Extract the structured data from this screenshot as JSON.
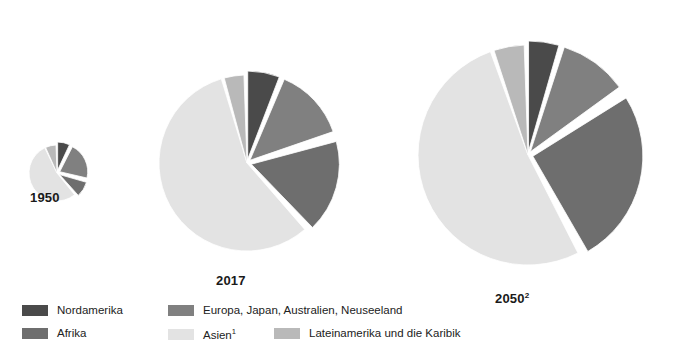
{
  "chart_data": {
    "type": "pie",
    "title": "",
    "subtitle": "",
    "xlabel": "",
    "ylabel": "",
    "legend_position": "bottom-left",
    "grid": false,
    "note": "Three area-proportional exploded pie charts comparing the regional distribution of world population in 1950, 2017 and 2050 (projection). Slice values are percentage shares read off the wedge angles; pie radius scales with total population.",
    "categories": [
      "Nordamerika",
      "Europa, Japan, Australien, Neuseeland",
      "Afrika",
      "Asien",
      "Lateinamerika und die Karibik"
    ],
    "colors": [
      "#4a4a4a",
      "#808080",
      "#6e6e6e",
      "#e3e3e3",
      "#b9b9b9"
    ],
    "series": [
      {
        "name": "1950",
        "label": "1950",
        "superscript": "",
        "relative_radius": 28,
        "values": [
          7,
          21,
          9,
          56,
          7
        ]
      },
      {
        "name": "2017",
        "label": "2017",
        "superscript": "",
        "relative_radius": 88,
        "values": [
          5,
          13,
          17,
          57,
          8
        ]
      },
      {
        "name": "2050",
        "label": "2050",
        "superscript": "2",
        "relative_radius": 110,
        "values": [
          4,
          10,
          26,
          52,
          8
        ]
      }
    ]
  },
  "pies": [
    {
      "id": "pie-1950",
      "label": "1950",
      "superscript": "",
      "cx": 57,
      "cy": 173,
      "r": 28,
      "label_x": 30,
      "label_y": 190,
      "label_size": 13,
      "slices": [
        {
          "name": "Nordamerika",
          "start": 0,
          "end": 25,
          "color": "#4a4a4a",
          "explode": 3.0
        },
        {
          "name": "Europa, Japan, Australien, Neuseeland",
          "start": 27,
          "end": 103,
          "color": "#808080",
          "explode": 3.0
        },
        {
          "name": "Afrika",
          "start": 106,
          "end": 138,
          "color": "#6e6e6e",
          "explode": 3.0
        },
        {
          "name": "Asien",
          "start": 141,
          "end": 334,
          "color": "#e3e3e3",
          "explode": 0.0
        },
        {
          "name": "Lateinamerika und die Karibik",
          "start": 336,
          "end": 358,
          "color": "#b9b9b9",
          "explode": 0.0
        }
      ]
    },
    {
      "id": "pie-2017",
      "label": "2017",
      "superscript": "",
      "cx": 247,
      "cy": 163,
      "r": 88,
      "label_x": 216,
      "label_y": 273,
      "label_size": 13,
      "slices": [
        {
          "name": "Nordamerika",
          "start": 0,
          "end": 21,
          "color": "#4a4a4a",
          "explode": 4.0
        },
        {
          "name": "Europa, Japan, Australien, Neuseeland",
          "start": 23,
          "end": 71,
          "color": "#808080",
          "explode": 4.0
        },
        {
          "name": "Afrika",
          "start": 75,
          "end": 136,
          "color": "#6e6e6e",
          "explode": 4.5
        },
        {
          "name": "Asien",
          "start": 139,
          "end": 343,
          "color": "#e3e3e3",
          "explode": 0.0
        },
        {
          "name": "Lateinamerika und die Karibik",
          "start": 345,
          "end": 358,
          "color": "#b9b9b9",
          "explode": 0.0
        }
      ]
    },
    {
      "id": "pie-2050",
      "label": "2050",
      "superscript": "2",
      "cx": 528,
      "cy": 155,
      "r": 110,
      "label_x": 495,
      "label_y": 291,
      "label_size": 13,
      "slices": [
        {
          "name": "Nordamerika",
          "start": 0,
          "end": 16,
          "color": "#4a4a4a",
          "explode": 4.0
        },
        {
          "name": "Europa, Japan, Australien, Neuseeland",
          "start": 18,
          "end": 54,
          "color": "#808080",
          "explode": 4.0
        },
        {
          "name": "Afrika",
          "start": 58,
          "end": 150,
          "color": "#6e6e6e",
          "explode": 5.0
        },
        {
          "name": "Asien",
          "start": 153,
          "end": 340,
          "color": "#e3e3e3",
          "explode": 0.0
        },
        {
          "name": "Lateinamerika und die Karibik",
          "start": 342,
          "end": 358,
          "color": "#b9b9b9",
          "explode": 0.0
        }
      ]
    }
  ],
  "legend": {
    "items": [
      {
        "label": "Nordamerika",
        "superscript": "",
        "color": "#4a4a4a",
        "x": 0,
        "y": 0
      },
      {
        "label": "Europa, Japan, Australien, Neuseeland",
        "superscript": "",
        "color": "#808080",
        "x": 146,
        "y": 0
      },
      {
        "label": "Afrika",
        "superscript": "",
        "color": "#6e6e6e",
        "x": 0,
        "y": 23
      },
      {
        "label": "Asien",
        "superscript": "1",
        "color": "#e3e3e3",
        "x": 146,
        "y": 23
      },
      {
        "label": "Lateinamerika und die Karibik",
        "superscript": "",
        "color": "#b9b9b9",
        "x": 252,
        "y": 23
      }
    ]
  },
  "footnote_strip": ""
}
